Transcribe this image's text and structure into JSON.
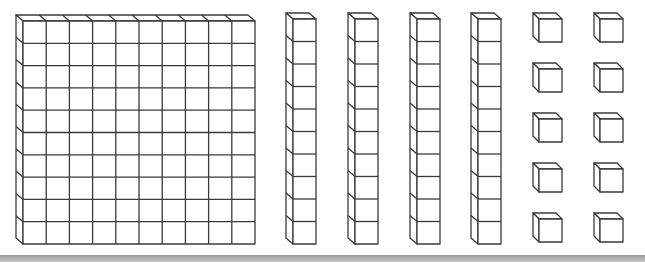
{
  "diagram": {
    "type": "base-ten-blocks",
    "represented_value": 150,
    "groups": [
      {
        "name": "hundreds",
        "block": "flat",
        "count": 1,
        "grid": [
          10,
          10
        ]
      },
      {
        "name": "tens",
        "block": "rod",
        "count": 4,
        "cubes_per_block": 10
      },
      {
        "name": "ones",
        "block": "unit-cube",
        "count": 10,
        "layout": [
          2,
          5
        ]
      }
    ],
    "colors": {
      "stroke": "#3a3a3a",
      "fill": "#ffffff",
      "bottom_bar": "#a8a8a8"
    }
  }
}
